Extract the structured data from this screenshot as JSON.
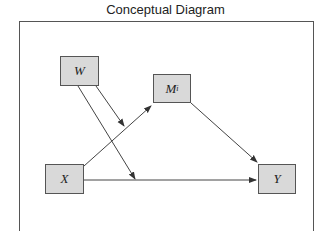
{
  "title": "Conceptual Diagram",
  "nodes": {
    "w": {
      "label": "W"
    },
    "m": {
      "label": "M",
      "subscript": "i"
    },
    "x": {
      "label": "X"
    },
    "y": {
      "label": "Y"
    }
  },
  "edges": [
    {
      "from": "X",
      "to": "M_i"
    },
    {
      "from": "M_i",
      "to": "Y"
    },
    {
      "from": "X",
      "to": "Y"
    },
    {
      "from": "W",
      "to": "X→M_i path"
    },
    {
      "from": "W",
      "to": "X→Y path"
    }
  ],
  "colors": {
    "node_fill": "#d9d9d9",
    "stroke": "#444444"
  }
}
